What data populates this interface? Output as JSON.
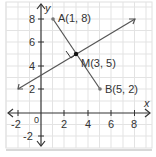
{
  "diagram": {
    "title": "",
    "axes": {
      "x_label": "x",
      "y_label": "y",
      "origin_label": "0",
      "x_ticks": [
        "-2",
        "2",
        "4",
        "6",
        "8"
      ],
      "y_ticks": [
        "-2",
        "2",
        "4",
        "6",
        "8"
      ],
      "x_range": [
        -3,
        9
      ],
      "y_range": [
        -3,
        9
      ],
      "grid": true
    },
    "points": [
      {
        "id": "A",
        "label": "A(1, 8)",
        "x": 1,
        "y": 8
      },
      {
        "id": "M",
        "label": "M(3, 5)",
        "x": 3,
        "y": 5
      },
      {
        "id": "B",
        "label": "B(5, 2)",
        "x": 5,
        "y": 2
      }
    ],
    "segments": [
      {
        "id": "AB",
        "from": [
          1,
          8
        ],
        "to": [
          5,
          2
        ],
        "kind": "segment"
      },
      {
        "id": "bisector",
        "from": [
          -2,
          2
        ],
        "to": [
          8,
          8
        ],
        "kind": "line-with-arrows"
      }
    ],
    "annotations": {
      "right_angle_at": "M"
    },
    "colors": {
      "grid": "#e3e3e3",
      "axis": "#333333",
      "line": "#555555",
      "point": "#111111",
      "endpoint": "#777777",
      "border": "#cccccc"
    }
  }
}
